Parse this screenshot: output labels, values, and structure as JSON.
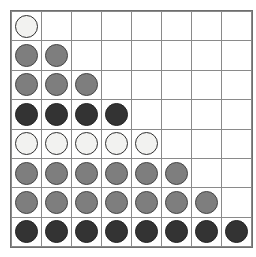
{
  "board": {
    "rows": 8,
    "columns": 8,
    "background_color": "#ffffff",
    "grid_line_color": "#8a8a8a",
    "border_color": "#6e6e6e",
    "legend": {
      "white": "#f2f2f0",
      "gray": "#7e7e7e",
      "dark": "#333333",
      "empty": "none"
    },
    "cells": [
      [
        "white",
        "empty",
        "empty",
        "empty",
        "empty",
        "empty",
        "empty",
        "empty"
      ],
      [
        "gray",
        "gray",
        "empty",
        "empty",
        "empty",
        "empty",
        "empty",
        "empty"
      ],
      [
        "gray",
        "gray",
        "gray",
        "empty",
        "empty",
        "empty",
        "empty",
        "empty"
      ],
      [
        "dark",
        "dark",
        "dark",
        "dark",
        "empty",
        "empty",
        "empty",
        "empty"
      ],
      [
        "white",
        "white",
        "white",
        "white",
        "white",
        "empty",
        "empty",
        "empty"
      ],
      [
        "gray",
        "gray",
        "gray",
        "gray",
        "gray",
        "gray",
        "empty",
        "empty"
      ],
      [
        "gray",
        "gray",
        "gray",
        "gray",
        "gray",
        "gray",
        "gray",
        "empty"
      ],
      [
        "dark",
        "dark",
        "dark",
        "dark",
        "dark",
        "dark",
        "dark",
        "dark"
      ]
    ],
    "row_fill_counts": [
      1,
      2,
      3,
      4,
      5,
      6,
      7,
      8
    ]
  }
}
